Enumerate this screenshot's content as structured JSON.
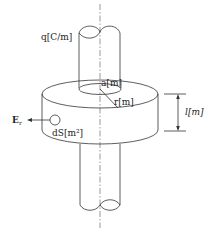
{
  "diagram": {
    "labels": {
      "line_charge": "q[C/m]",
      "inner_radius": "a[m]",
      "radius": "r[m]",
      "length": "l[m]",
      "field": "E",
      "field_sub": "r",
      "surface_element": "dS[m²]"
    },
    "colors": {
      "line": "#333333",
      "axis": "#555555",
      "text": "#222222",
      "background": "#ffffff"
    }
  }
}
